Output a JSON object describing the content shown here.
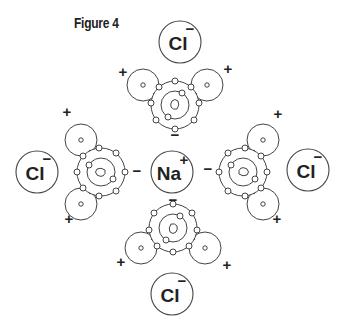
{
  "figure": {
    "title": "Figure 4",
    "center_ion": {
      "symbol": "Na",
      "charge": "+"
    },
    "outer_ions": [
      {
        "position": "top",
        "symbol": "Cl",
        "charge": "−"
      },
      {
        "position": "left",
        "symbol": "Cl",
        "charge": "−"
      },
      {
        "position": "right",
        "symbol": "Cl",
        "charge": "−"
      },
      {
        "position": "bottom",
        "symbol": "Cl",
        "charge": "−"
      }
    ],
    "water_molecules": [
      {
        "position": "top",
        "oxygen_partial_charge": "−",
        "hydrogen_partial_charges": [
          "+",
          "+"
        ]
      },
      {
        "position": "left",
        "oxygen_partial_charge": "−",
        "hydrogen_partial_charges": [
          "+",
          "+"
        ]
      },
      {
        "position": "right",
        "oxygen_partial_charge": "−",
        "hydrogen_partial_charges": [
          "+",
          "+"
        ]
      },
      {
        "position": "bottom",
        "oxygen_partial_charge": "−",
        "hydrogen_partial_charges": [
          "+",
          "+"
        ]
      }
    ]
  },
  "colors": {
    "line": "#444444",
    "text": "#222222",
    "background": "#ffffff"
  }
}
